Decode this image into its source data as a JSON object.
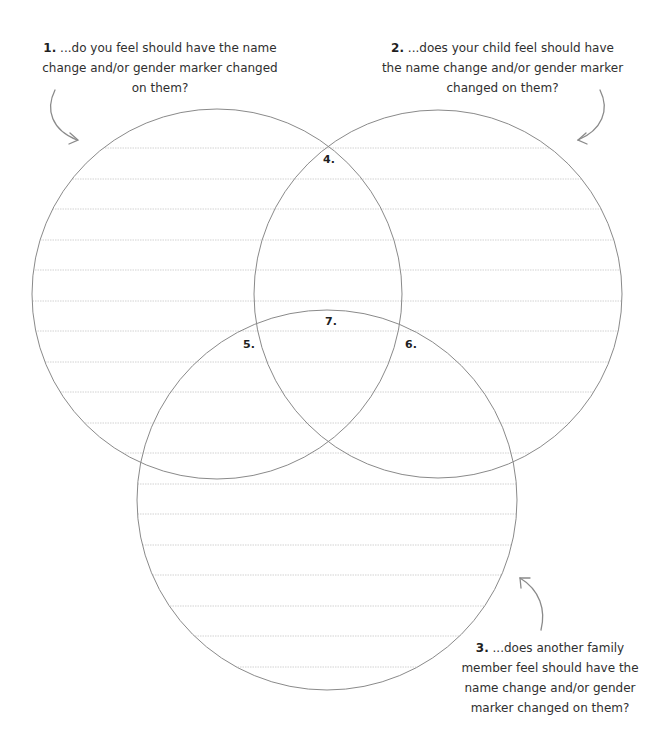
{
  "prompts": [
    {
      "num": "1.",
      "text": " ...do you feel should have the name change and/or gender marker changed on them?"
    },
    {
      "num": "2.",
      "text": " ...does your child feel should have the name change and/or gender marker changed on them?"
    },
    {
      "num": "3.",
      "text": " ...does another family member feel should have the name change and/or gender marker changed on them?"
    }
  ],
  "regions": {
    "r4": "4.",
    "r5": "5.",
    "r6": "6.",
    "r7": "7."
  },
  "colors": {
    "circle_stroke": "#8a8a8a",
    "rule_line": "#cfcfcf",
    "arrow": "#8a8a8a"
  }
}
